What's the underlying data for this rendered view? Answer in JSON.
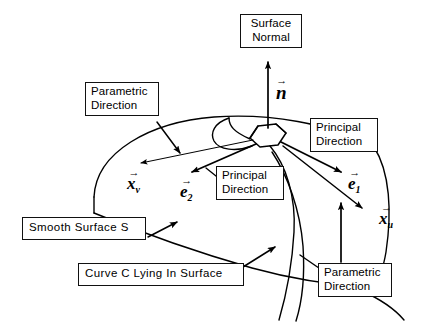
{
  "figure": {
    "background_color": "#ffffff",
    "ink_color": "#000000"
  },
  "callouts": {
    "surface_normal": "Surface\nNormal",
    "parametric_direction_top_left": "Parametric\nDirection",
    "principal_direction_right": "Principal\nDirection",
    "principal_direction_center": "Principal\nDirection",
    "smooth_surface": "Smooth Surface S",
    "curve_c": "Curve C Lying In Surface",
    "parametric_direction_bottom_right": "Parametric\nDirection"
  },
  "vectors": {
    "normal": {
      "symbol": "n",
      "subscript": "",
      "arrow": "→"
    },
    "x_v": {
      "symbol": "x",
      "subscript": "v",
      "arrow": "→"
    },
    "e_2": {
      "symbol": "e",
      "subscript": "2",
      "arrow": "→"
    },
    "e_1": {
      "symbol": "e",
      "subscript": "1",
      "arrow": "→"
    },
    "x_u": {
      "symbol": "x",
      "subscript": "u",
      "arrow": "→"
    }
  }
}
